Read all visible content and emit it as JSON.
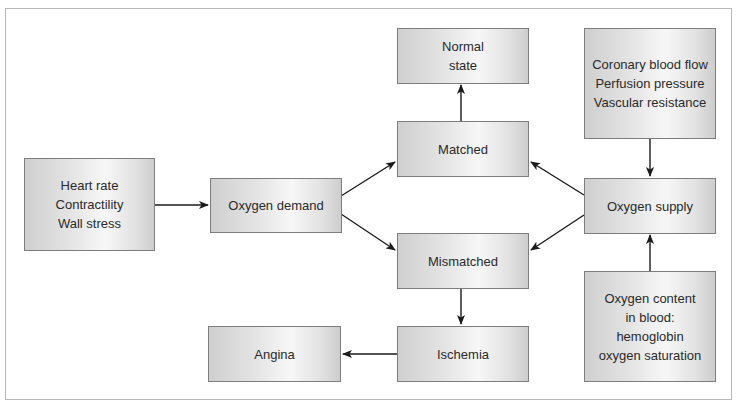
{
  "diagram": {
    "type": "flowchart",
    "title": "",
    "nodes": {
      "determinants_demand": {
        "lines": [
          "Heart rate",
          "Contractility",
          "Wall stress"
        ]
      },
      "oxygen_demand": {
        "lines": [
          "Oxygen demand"
        ]
      },
      "normal_state": {
        "lines": [
          "Normal",
          "state"
        ]
      },
      "matched": {
        "lines": [
          "Matched"
        ]
      },
      "mismatched": {
        "lines": [
          "Mismatched"
        ]
      },
      "ischemia": {
        "lines": [
          "Ischemia"
        ]
      },
      "angina": {
        "lines": [
          "Angina"
        ]
      },
      "determinants_supply": {
        "lines": [
          "Coronary blood flow",
          "Perfusion pressure",
          "Vascular resistance"
        ]
      },
      "oxygen_supply": {
        "lines": [
          "Oxygen supply"
        ]
      },
      "oxygen_content": {
        "lines": [
          "Oxygen content",
          "in blood:",
          "hemoglobin",
          "oxygen saturation"
        ]
      }
    },
    "edges": [
      {
        "from": "determinants_demand",
        "to": "oxygen_demand"
      },
      {
        "from": "oxygen_demand",
        "to": "matched"
      },
      {
        "from": "oxygen_demand",
        "to": "mismatched"
      },
      {
        "from": "oxygen_supply",
        "to": "matched"
      },
      {
        "from": "oxygen_supply",
        "to": "mismatched"
      },
      {
        "from": "matched",
        "to": "normal_state"
      },
      {
        "from": "mismatched",
        "to": "ischemia"
      },
      {
        "from": "ischemia",
        "to": "angina"
      },
      {
        "from": "determinants_supply",
        "to": "oxygen_supply"
      },
      {
        "from": "oxygen_content",
        "to": "oxygen_supply"
      }
    ],
    "colors": {
      "box_border": "#7d7d7d",
      "box_fill_edge": "#cfcfcf",
      "box_fill_center": "#f7f7f7",
      "text": "#2a2a2a",
      "arrow": "#1a1a1a",
      "frame_border": "#b8b8b8"
    }
  }
}
